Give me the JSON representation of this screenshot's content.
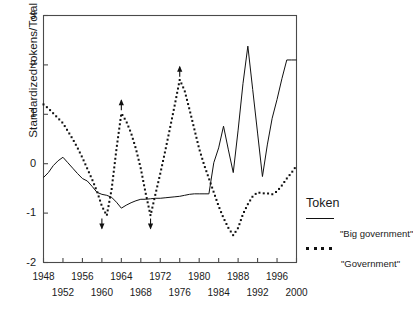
{
  "chart_data": {
    "type": "line",
    "title": "",
    "xlabel": "",
    "ylabel": "Standardized tokens/Total words",
    "xlim": [
      1948,
      2000
    ],
    "ylim": [
      -2,
      3
    ],
    "grid": false,
    "legend_position": "right",
    "legend_title": "Token",
    "y_ticks": [
      3,
      2,
      1,
      0,
      -1,
      -2
    ],
    "y_tick_labels": [
      "3",
      "2",
      "1",
      "0",
      "-1",
      "-2"
    ],
    "x_ticks_row1": [
      "1948",
      "1956",
      "1964",
      "1972",
      "1980",
      "1988",
      "1996"
    ],
    "x_ticks_row2": [
      "1952",
      "1960",
      "1968",
      "1976",
      "1984",
      "1992",
      "2000"
    ],
    "x_tick_values_row1": [
      1948,
      1956,
      1964,
      1972,
      1980,
      1988,
      1996
    ],
    "x_tick_values_row2": [
      1952,
      1960,
      1968,
      1976,
      1984,
      1992,
      2000
    ],
    "series": [
      {
        "name": "\"Big government\"",
        "style": "solid",
        "color": "#111111",
        "x": [
          1948,
          1949,
          1950,
          1951,
          1952,
          1953,
          1954,
          1955,
          1956,
          1957,
          1958,
          1959,
          1960,
          1961,
          1962,
          1963,
          1964,
          1965,
          1966,
          1967,
          1968,
          1969,
          1970,
          1971,
          1972,
          1973,
          1974,
          1975,
          1976,
          1977,
          1978,
          1979,
          1980,
          1981,
          1982,
          1983,
          1984,
          1985,
          1986,
          1987,
          1988,
          1989,
          1990,
          1991,
          1992,
          1993,
          1994,
          1995,
          1996,
          1997,
          1998,
          1999,
          2000
        ],
        "values": [
          -0.28,
          -0.18,
          -0.04,
          0.06,
          0.13,
          0.02,
          -0.09,
          -0.2,
          -0.3,
          -0.35,
          -0.46,
          -0.58,
          -0.62,
          -0.64,
          -0.68,
          -0.78,
          -0.9,
          -0.84,
          -0.79,
          -0.75,
          -0.72,
          -0.72,
          -0.71,
          -0.7,
          -0.7,
          -0.69,
          -0.68,
          -0.67,
          -0.66,
          -0.64,
          -0.62,
          -0.61,
          -0.61,
          -0.61,
          -0.61,
          0.02,
          0.32,
          0.76,
          0.28,
          -0.18,
          0.68,
          1.62,
          2.38,
          1.5,
          0.62,
          -0.26,
          0.38,
          0.92,
          1.3,
          1.72,
          2.1,
          2.1,
          2.1
        ]
      },
      {
        "name": "\"Government\"",
        "style": "dotted",
        "color": "#111111",
        "x": [
          1948,
          1949,
          1950,
          1951,
          1952,
          1953,
          1954,
          1955,
          1956,
          1957,
          1958,
          1959,
          1960,
          1961,
          1962,
          1963,
          1964,
          1965,
          1966,
          1967,
          1968,
          1969,
          1970,
          1971,
          1972,
          1973,
          1974,
          1975,
          1976,
          1977,
          1978,
          1979,
          1980,
          1981,
          1982,
          1983,
          1984,
          1985,
          1986,
          1987,
          1988,
          1989,
          1990,
          1991,
          1992,
          1993,
          1994,
          1995,
          1996,
          1997,
          1998,
          1999,
          2000
        ],
        "values": [
          1.2,
          1.12,
          1.02,
          0.92,
          0.82,
          0.66,
          0.5,
          0.32,
          0.12,
          -0.1,
          -0.32,
          -0.56,
          -0.86,
          -1.05,
          -0.52,
          0.3,
          1.02,
          0.86,
          0.62,
          0.3,
          -0.1,
          -0.6,
          -1.05,
          -0.62,
          -0.2,
          0.25,
          0.72,
          1.2,
          1.7,
          1.48,
          1.1,
          0.7,
          0.3,
          -0.02,
          -0.3,
          -0.58,
          -0.86,
          -1.1,
          -1.3,
          -1.45,
          -1.3,
          -1.02,
          -0.82,
          -0.66,
          -0.58,
          -0.6,
          -0.6,
          -0.62,
          -0.56,
          -0.44,
          -0.3,
          -0.18,
          -0.04
        ]
      }
    ],
    "annotations": [
      {
        "kind": "arrow-up",
        "x": 1964,
        "y": 1.02,
        "note": "clipped peak marker"
      },
      {
        "kind": "arrow-up",
        "x": 1976,
        "y": 1.7,
        "note": "clipped peak marker"
      },
      {
        "kind": "arrow-down",
        "x": 1960,
        "y": -1.05,
        "note": "clipped trough marker"
      },
      {
        "kind": "arrow-down",
        "x": 1970,
        "y": -1.05,
        "note": "clipped trough marker"
      }
    ]
  },
  "legend": {
    "title": "Token",
    "entries": [
      {
        "label": "\"Big government\"",
        "style": "solid"
      },
      {
        "label": "\"Government\"",
        "style": "dotted"
      }
    ]
  },
  "axes": {
    "y_label": "Standardized tokens/Total words"
  }
}
